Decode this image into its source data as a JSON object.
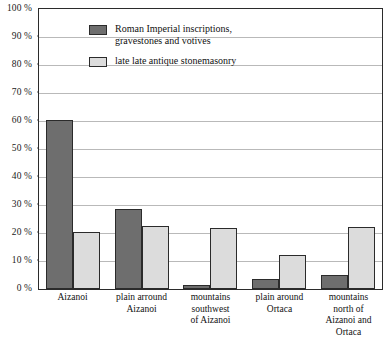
{
  "chart_data": {
    "type": "bar",
    "title": "",
    "subtitle": "",
    "xlabel": "",
    "ylabel": "",
    "ylim": [
      0,
      100
    ],
    "grid": true,
    "legend_position": "top-left",
    "categories": [
      "Aizanoi",
      "plain arround\nAizanoi",
      "mountains\nsouthwest\nof Aizanoi",
      "plain around\nOrtaca",
      "mountains\nnorth of\nAizanoi and\nOrtaca"
    ],
    "series": [
      {
        "name": "Roman Imperial inscriptions,\ngravestones and votives",
        "color": "#6e6e6e",
        "values": [
          60.5,
          28.5,
          1.5,
          3.5,
          5.0
        ]
      },
      {
        "name": "late late antique stonemasonry",
        "color": "#dcdcdc",
        "values": [
          20.5,
          22.5,
          21.8,
          12.0,
          22.0
        ]
      }
    ],
    "y_ticks": [
      {
        "value": 100,
        "label": "100 %"
      },
      {
        "value": 90,
        "label": "90 %"
      },
      {
        "value": 80,
        "label": "80 %"
      },
      {
        "value": 70,
        "label": "70 %"
      },
      {
        "value": 60,
        "label": "60 %"
      },
      {
        "value": 50,
        "label": "50 %"
      },
      {
        "value": 40,
        "label": "40 %"
      },
      {
        "value": 30,
        "label": "30 %"
      },
      {
        "value": 20,
        "label": "20 %"
      },
      {
        "value": 10,
        "label": "10 %"
      },
      {
        "value": 0,
        "label": "0 %"
      }
    ]
  },
  "colors": {
    "series_dark": "#6e6e6e",
    "series_light": "#dcdcdc",
    "axis": "#2b2b2b",
    "gridline": "#b9b9b9",
    "text": "#111111",
    "background": "#ffffff"
  }
}
